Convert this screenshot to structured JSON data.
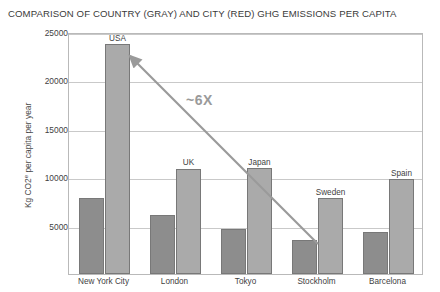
{
  "chart_data": {
    "type": "bar",
    "title": "COMPARISON OF COUNTRY (GRAY) AND CITY (RED) GHG EMISSIONS PER CAPITA",
    "xlabel": "",
    "ylabel": "Kg CO2e per capita per year",
    "ylabel_prefix": "Kg CO2",
    "ylabel_sup": "e",
    "ylabel_suffix": " per capita per year",
    "categories": [
      "New York City",
      "London",
      "Tokyo",
      "Stockholm",
      "Barcelona"
    ],
    "country_names": [
      "USA",
      "UK",
      "Japan",
      "Sweden",
      "Spain"
    ],
    "series": [
      {
        "name": "City",
        "color": "#8d8d8d",
        "values": [
          7900,
          6100,
          4700,
          3500,
          4300
        ]
      },
      {
        "name": "Country",
        "color": "#aaaaaa",
        "values": [
          23800,
          10900,
          11000,
          7900,
          9800
        ]
      }
    ],
    "ylim": [
      0,
      25000
    ],
    "yticks": [
      5000,
      10000,
      15000,
      20000,
      25000
    ],
    "ytick_labels": [
      "5000",
      "10000",
      "15000",
      "20000",
      "25000"
    ],
    "grid": true,
    "legend": "none",
    "annotations": [
      {
        "name": "ratio-annotation",
        "text": "~6X"
      }
    ]
  }
}
